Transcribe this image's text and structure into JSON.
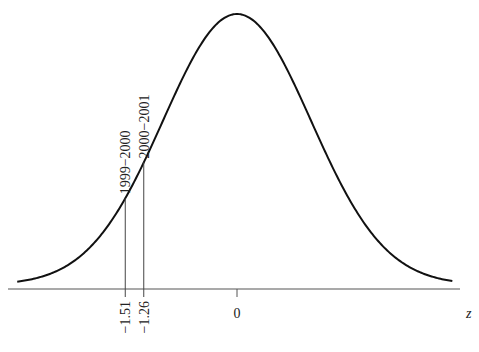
{
  "chart_data": {
    "type": "line",
    "title": "",
    "xlabel": "z",
    "ylabel": "",
    "x_range": [
      -3.0,
      3.0
    ],
    "mean": 0,
    "sd": 1,
    "tick_labels": [
      "−1.51",
      "−1.26",
      "0"
    ],
    "ticks": [
      -1.51,
      -1.26,
      0
    ],
    "markers": [
      {
        "z": -1.51,
        "label": "1999−2000"
      },
      {
        "z": -1.26,
        "label": "2000−2001"
      }
    ],
    "grid": false,
    "legend": null
  },
  "axis": {
    "xlabel": "z",
    "zero_label": "0"
  },
  "markers": {
    "m0": {
      "label": "1999−2000",
      "tick": "−1.51"
    },
    "m1": {
      "label": "2000−2001",
      "tick": "−1.26"
    }
  }
}
